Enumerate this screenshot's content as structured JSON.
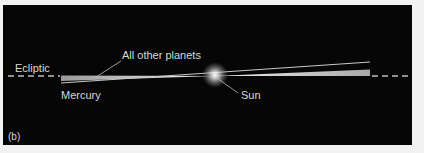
{
  "figure": {
    "panel_label": "(b)",
    "background_color": "#060606",
    "labels": {
      "ecliptic": "Ecliptic",
      "all_other_planets": "All other planets",
      "mercury": "Mercury",
      "sun": "Sun"
    },
    "colors": {
      "label_text": "#d8d8d8",
      "orbit_wedge": "#cfcfcf",
      "dashed_line": "#bdbdbd",
      "sun_glow": "#ffffff"
    }
  }
}
